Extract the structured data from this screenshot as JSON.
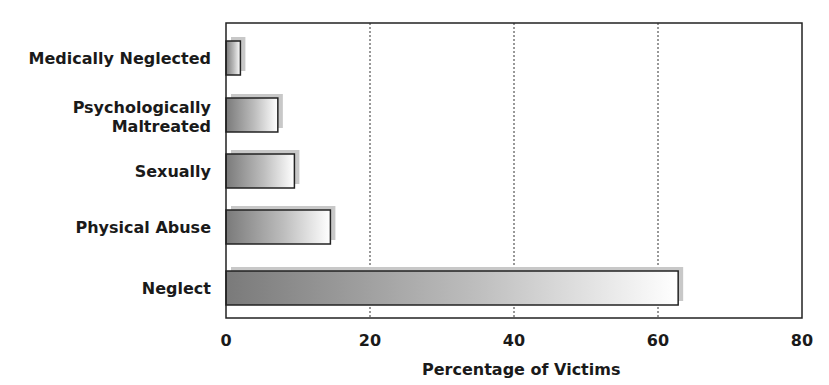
{
  "chart_data": {
    "type": "bar",
    "orientation": "horizontal",
    "title": "",
    "xlabel": "Percentage of Victims",
    "ylabel": "",
    "categories": [
      "Medically Neglected",
      "Psychologically Maltreated",
      "Sexually",
      "Physical Abuse",
      "Neglect"
    ],
    "category_lines": [
      [
        "Medically Neglected"
      ],
      [
        "Psychologically",
        "Maltreated"
      ],
      [
        "Sexually"
      ],
      [
        "Physical Abuse"
      ],
      [
        "Neglect"
      ]
    ],
    "values": [
      2.0,
      7.2,
      9.5,
      14.5,
      62.8
    ],
    "xlim": [
      0,
      80
    ],
    "x_ticks": [
      0,
      20,
      40,
      60,
      80
    ],
    "x_tick_labels": [
      "0",
      "20",
      "40",
      "60",
      "80"
    ],
    "grid": {
      "x": true,
      "style": "dotted",
      "at": [
        20,
        40,
        60
      ]
    },
    "legend": null,
    "bar_style": "gradient dark-to-light gray with drop shadow"
  },
  "colors": {
    "bar_dark": "#7a7a7a",
    "bar_light": "#ffffff",
    "bar_border": "#222222",
    "shadow": "#c8c8c8",
    "axis": "#222222",
    "grid": "#333333"
  }
}
